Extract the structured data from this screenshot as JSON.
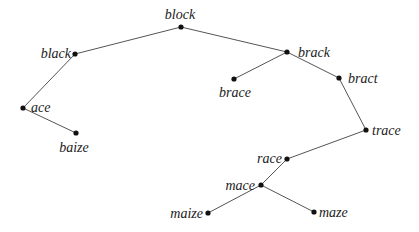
{
  "diagram": {
    "type": "tree",
    "root": "block",
    "nodes": [
      {
        "id": "block",
        "label": "block",
        "x": 181,
        "y": 27,
        "lx": 180,
        "ly": 19,
        "anchor": "middle"
      },
      {
        "id": "black",
        "label": "black",
        "x": 75,
        "y": 54,
        "lx": 71,
        "ly": 58,
        "anchor": "end"
      },
      {
        "id": "ace",
        "label": "ace",
        "x": 23,
        "y": 108,
        "lx": 31,
        "ly": 112,
        "anchor": "start"
      },
      {
        "id": "baize",
        "label": "baize",
        "x": 76,
        "y": 133,
        "lx": 74,
        "ly": 152,
        "anchor": "middle"
      },
      {
        "id": "brack",
        "label": "brack",
        "x": 287,
        "y": 52,
        "lx": 298,
        "ly": 57,
        "anchor": "start"
      },
      {
        "id": "brace",
        "label": "brace",
        "x": 234,
        "y": 79,
        "lx": 235,
        "ly": 97,
        "anchor": "middle"
      },
      {
        "id": "bract",
        "label": "bract",
        "x": 339,
        "y": 78,
        "lx": 348,
        "ly": 83,
        "anchor": "start"
      },
      {
        "id": "trace",
        "label": "trace",
        "x": 366,
        "y": 130,
        "lx": 372,
        "ly": 135,
        "anchor": "start"
      },
      {
        "id": "race",
        "label": "race",
        "x": 287,
        "y": 159,
        "lx": 282,
        "ly": 163,
        "anchor": "end"
      },
      {
        "id": "mace",
        "label": "mace",
        "x": 261,
        "y": 185,
        "lx": 255,
        "ly": 190,
        "anchor": "end"
      },
      {
        "id": "maize",
        "label": "maize",
        "x": 208,
        "y": 213,
        "lx": 203,
        "ly": 218,
        "anchor": "end"
      },
      {
        "id": "maze",
        "label": "maze",
        "x": 314,
        "y": 212,
        "lx": 319,
        "ly": 217,
        "anchor": "start"
      }
    ],
    "edges": [
      [
        "block",
        "black"
      ],
      [
        "block",
        "brack"
      ],
      [
        "black",
        "ace"
      ],
      [
        "ace",
        "baize"
      ],
      [
        "brack",
        "brace"
      ],
      [
        "brack",
        "bract"
      ],
      [
        "bract",
        "trace"
      ],
      [
        "trace",
        "race"
      ],
      [
        "race",
        "mace"
      ],
      [
        "mace",
        "maize"
      ],
      [
        "mace",
        "maze"
      ]
    ]
  }
}
